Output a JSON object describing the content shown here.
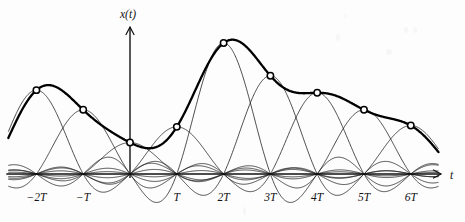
{
  "figure": {
    "title": "",
    "y_axis_label": "x(t)",
    "x_axis_label": "t",
    "background_color": "#fdfdfd",
    "ink_color": "#111111",
    "envelope_color": "#000000",
    "marker_fill": "#fdfdfd"
  },
  "chart_data": {
    "type": "line",
    "title": "",
    "subtitle": "",
    "xlabel": "t",
    "ylabel": "x(t)",
    "grid": false,
    "legend": null,
    "x_tick_labels": [
      "-2T",
      "-T",
      "",
      "T",
      "2T",
      "3T",
      "4T",
      "5T",
      "6T"
    ],
    "x_tick_values": [
      -2,
      -1,
      0,
      1,
      2,
      3,
      4,
      5,
      6
    ],
    "x_tick_label_shown": [
      true,
      true,
      false,
      true,
      true,
      true,
      true,
      true,
      true
    ],
    "xlim": [
      -2.6,
      6.6
    ],
    "ylim": [
      -0.25,
      1.12
    ],
    "sample_instants": [
      -2,
      -1,
      0,
      1,
      2,
      3,
      4,
      5,
      6
    ],
    "sample_values": [
      0.64,
      0.49,
      0.24,
      0.36,
      1.0,
      0.75,
      0.62,
      0.49,
      0.37
    ],
    "series": [
      {
        "name": "x(t) reconstructed",
        "style": "thick",
        "x": [
          -2,
          -1,
          0,
          1,
          2,
          3,
          4,
          5,
          6
        ],
        "values": [
          0.64,
          0.49,
          0.24,
          0.36,
          1.0,
          0.75,
          0.62,
          0.49,
          0.37
        ]
      },
      {
        "name": "sinc basis functions",
        "style": "thin",
        "count": 9,
        "centers": [
          -2,
          -1,
          0,
          1,
          2,
          3,
          4,
          5,
          6
        ],
        "amplitudes": [
          0.64,
          0.49,
          0.24,
          0.36,
          1.0,
          0.75,
          0.62,
          0.49,
          0.37
        ]
      }
    ],
    "markers": {
      "shape": "open-circle",
      "radius_px": 3.2,
      "count": 9
    }
  },
  "geometry": {
    "origin_x_px": 130,
    "baseline_y_px": 174,
    "sample_spacing_px": 46.8,
    "unit_amplitude_px": 131,
    "y_axis_top_px": 27,
    "x_axis_right_px": 441
  }
}
